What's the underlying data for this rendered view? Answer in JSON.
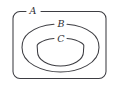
{
  "diagram": {
    "type": "nested-set-venn-diagram",
    "background_color": "#ffffff",
    "stroke_color": "#3d3d42",
    "label_color": "#2e2e33",
    "sets": [
      {
        "id": "A",
        "label": "A",
        "shape": "rounded-rectangle",
        "level": 0,
        "label_x": 33,
        "label_y": 11.5,
        "label_gap_start": 26,
        "label_gap_end": 41
      },
      {
        "id": "B",
        "label": "B",
        "shape": "ellipse",
        "level": 1,
        "label_x": 61,
        "label_y": 24.5,
        "label_gap_start": 54,
        "label_gap_end": 69
      },
      {
        "id": "C",
        "label": "C",
        "shape": "ellipse",
        "level": 2,
        "label_x": 61,
        "label_y": 39.5,
        "label_gap_start": 54,
        "label_gap_end": 69
      }
    ],
    "geometry": {
      "rect_a": {
        "x": 13,
        "y": 11.5,
        "width": 93,
        "height": 67,
        "rx": 7
      },
      "ellipse_b": {
        "cx": 60.5,
        "cy": 47.5,
        "rx": 38.5,
        "ry": 24.5
      },
      "ellipse_c": {
        "cx": 60.5,
        "cy": 51.5,
        "rx": 23,
        "ry": 13.5
      }
    }
  }
}
